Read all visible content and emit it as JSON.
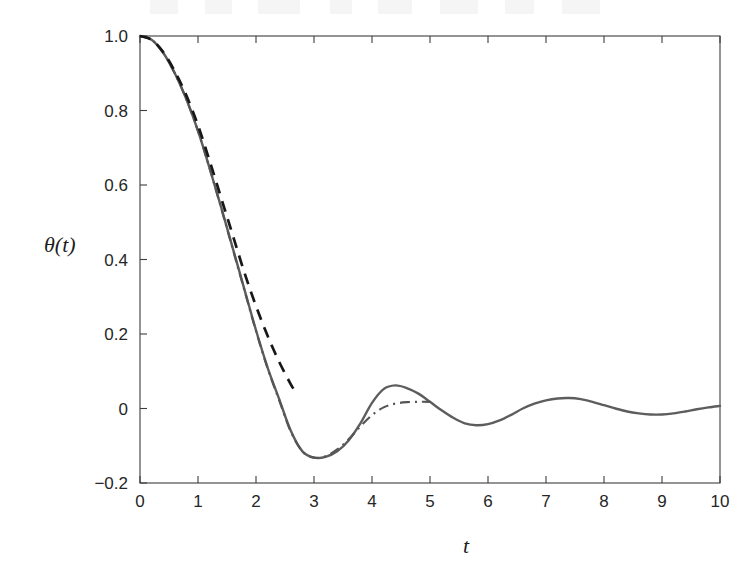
{
  "figure": {
    "background_color": "#ffffff",
    "plot_area": {
      "left": 140,
      "top": 36,
      "right": 720,
      "bottom": 483
    }
  },
  "chart_data": {
    "type": "line",
    "title": "",
    "xlabel": "t",
    "ylabel": "θ(t)",
    "xlim": [
      0,
      10
    ],
    "ylim": [
      -0.2,
      1.0
    ],
    "xticks": [
      0,
      1,
      2,
      3,
      4,
      5,
      6,
      7,
      8,
      9,
      10
    ],
    "xticklabels": [
      "0",
      "1",
      "2",
      "3",
      "4",
      "5",
      "6",
      "7",
      "8",
      "9",
      "10"
    ],
    "yticks": [
      -0.2,
      0,
      0.2,
      0.4,
      0.6,
      0.8,
      1.0
    ],
    "yticklabels": [
      "-0.2",
      "0",
      "0.2",
      "0.4",
      "0.6",
      "0.8",
      "1.0"
    ],
    "grid": false,
    "legend": "none",
    "box_frame": true,
    "series": [
      {
        "name": "solid",
        "style": "solid",
        "color": "#5d5d5d",
        "x": [
          0,
          0.2,
          0.4,
          0.6,
          0.8,
          1.0,
          1.2,
          1.4,
          1.6,
          1.8,
          2.0,
          2.2,
          2.4,
          2.6,
          2.8,
          3.0,
          3.2,
          3.4,
          3.6,
          3.8,
          4.0,
          4.2,
          4.4,
          4.6,
          4.8,
          5.0,
          5.2,
          5.4,
          5.6,
          5.8,
          6.0,
          6.2,
          6.4,
          6.6,
          6.8,
          7.0,
          7.2,
          7.4,
          7.6,
          7.8,
          8.0,
          8.2,
          8.4,
          8.6,
          8.8,
          9.0,
          9.2,
          9.4,
          9.6,
          9.8,
          10.0
        ],
        "y": [
          1.0,
          0.99,
          0.955,
          0.9,
          0.83,
          0.745,
          0.645,
          0.54,
          0.43,
          0.32,
          0.21,
          0.11,
          0.025,
          -0.06,
          -0.115,
          -0.132,
          -0.13,
          -0.115,
          -0.085,
          -0.04,
          0.015,
          0.052,
          0.062,
          0.055,
          0.04,
          0.018,
          -0.005,
          -0.025,
          -0.04,
          -0.045,
          -0.042,
          -0.032,
          -0.017,
          0.0,
          0.013,
          0.022,
          0.027,
          0.028,
          0.025,
          0.018,
          0.009,
          0.0,
          -0.008,
          -0.013,
          -0.016,
          -0.016,
          -0.013,
          -0.008,
          -0.002,
          0.003,
          0.007
        ]
      },
      {
        "name": "dashed",
        "style": "dashed",
        "color": "#181818",
        "x": [
          0,
          0.2,
          0.4,
          0.6,
          0.8,
          1.0,
          1.2,
          1.4,
          1.6,
          1.8,
          2.0,
          2.2,
          2.4,
          2.6,
          2.7
        ],
        "y": [
          1.0,
          0.99,
          0.957,
          0.905,
          0.84,
          0.76,
          0.665,
          0.565,
          0.465,
          0.365,
          0.275,
          0.195,
          0.125,
          0.065,
          0.04
        ]
      },
      {
        "name": "dash-dot",
        "style": "dashdot",
        "color": "#555555",
        "x": [
          0,
          0.2,
          0.4,
          0.6,
          0.8,
          1.0,
          1.2,
          1.4,
          1.6,
          1.8,
          2.0,
          2.2,
          2.4,
          2.6,
          2.8,
          3.0,
          3.2,
          3.4,
          3.6,
          3.8,
          4.0,
          4.2,
          4.4,
          4.6,
          4.8,
          5.0
        ],
        "y": [
          1.0,
          0.99,
          0.955,
          0.9,
          0.83,
          0.745,
          0.645,
          0.538,
          0.428,
          0.318,
          0.208,
          0.108,
          0.022,
          -0.062,
          -0.115,
          -0.132,
          -0.128,
          -0.11,
          -0.082,
          -0.048,
          -0.018,
          0.003,
          0.013,
          0.017,
          0.018,
          0.018
        ]
      }
    ]
  }
}
